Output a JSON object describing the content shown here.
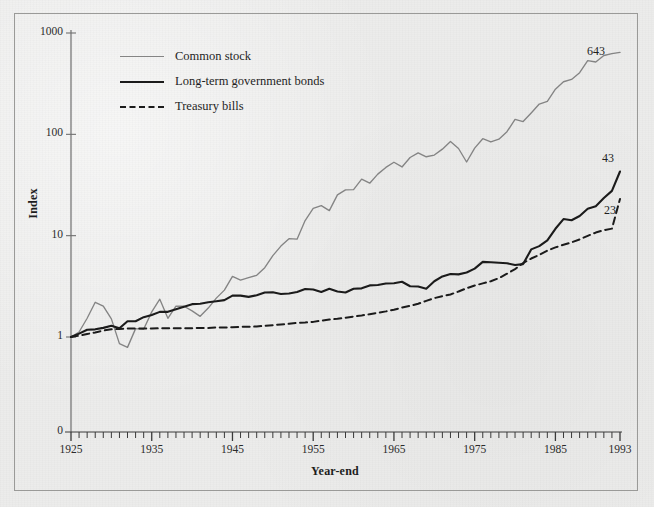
{
  "figure": {
    "background_color": "#ececeb",
    "frame_color": "#9a9a98"
  },
  "axes": {
    "y_title": "Index",
    "x_title": "Year-end",
    "y_scale": "log",
    "y_tick_labels": [
      "1000",
      "100",
      "10",
      "1",
      "0"
    ],
    "y_tick_values": [
      1000,
      100,
      10,
      1,
      0
    ],
    "x_tick_labels": [
      "1925",
      "1935",
      "1945",
      "1955",
      "1965",
      "1975",
      "1985",
      "1993"
    ],
    "x_tick_values": [
      1925,
      1935,
      1945,
      1955,
      1965,
      1975,
      1985,
      1993
    ],
    "x_minor_tick_interval_years": 1,
    "x_range": [
      1925,
      1993
    ],
    "y_range": [
      1,
      1000
    ]
  },
  "legend": {
    "position": "top-left-inside",
    "items": [
      {
        "label": "Common stock",
        "style": "solid",
        "color": "#848484",
        "width": 1.3
      },
      {
        "label": "Long-term government bonds",
        "style": "solid",
        "color": "#1b1b1b",
        "width": 2.1
      },
      {
        "label": "Treasury bills",
        "style": "dashed",
        "color": "#1b1b1b",
        "width": 2.0
      }
    ]
  },
  "endpoint_labels": [
    {
      "text": "643",
      "series": "Common stock"
    },
    {
      "text": "43",
      "series": "Long-term government bonds"
    },
    {
      "text": "23",
      "series": "Treasury bills"
    }
  ],
  "chart_data": {
    "type": "line",
    "title": "",
    "subtitle": "",
    "xlabel": "Year-end",
    "ylabel": "Index",
    "xlim": [
      1925,
      1993
    ],
    "ylim": [
      1,
      1000
    ],
    "yscale": "log",
    "grid": false,
    "legend_position": "upper left",
    "x": [
      1925,
      1926,
      1927,
      1928,
      1929,
      1930,
      1931,
      1932,
      1933,
      1934,
      1935,
      1936,
      1937,
      1938,
      1939,
      1940,
      1941,
      1942,
      1943,
      1944,
      1945,
      1946,
      1947,
      1948,
      1949,
      1950,
      1951,
      1952,
      1953,
      1954,
      1955,
      1956,
      1957,
      1958,
      1959,
      1960,
      1961,
      1962,
      1963,
      1964,
      1965,
      1966,
      1967,
      1968,
      1969,
      1970,
      1971,
      1972,
      1973,
      1974,
      1975,
      1976,
      1977,
      1978,
      1979,
      1980,
      1981,
      1982,
      1983,
      1984,
      1985,
      1986,
      1987,
      1988,
      1989,
      1990,
      1991,
      1992,
      1993
    ],
    "series": [
      {
        "name": "Common stock",
        "color": "#848484",
        "style": "solid",
        "end_label": "643",
        "values": [
          1.0,
          1.12,
          1.53,
          2.2,
          2.02,
          1.51,
          0.86,
          0.79,
          1.21,
          1.19,
          1.77,
          2.36,
          1.53,
          2.02,
          2.01,
          1.81,
          1.6,
          1.93,
          2.42,
          2.9,
          3.96,
          3.64,
          3.85,
          4.06,
          4.83,
          6.36,
          7.89,
          9.34,
          9.24,
          14.11,
          18.57,
          19.78,
          17.65,
          25.3,
          28.32,
          28.46,
          36.11,
          32.96,
          40.47,
          47.16,
          53.01,
          47.67,
          59.11,
          65.63,
          60.06,
          62.47,
          71.41,
          84.95,
          72.5,
          53.3,
          73.14,
          90.58,
          84.08,
          89.58,
          106.11,
          140.5,
          133.62,
          162.42,
          199.06,
          211.59,
          278.62,
          330.46,
          347.89,
          405.6,
          533.91,
          517.5,
          675.59,
          727.38,
          800.08
        ],
        "plot_values": [
          1.0,
          1.12,
          1.53,
          2.2,
          2.02,
          1.51,
          0.86,
          0.79,
          1.21,
          1.19,
          1.77,
          2.36,
          1.53,
          2.02,
          2.01,
          1.81,
          1.6,
          1.93,
          2.42,
          2.9,
          3.96,
          3.64,
          3.85,
          4.06,
          4.83,
          6.36,
          7.89,
          9.34,
          9.24,
          14.11,
          18.57,
          19.78,
          17.65,
          25.3,
          28.32,
          28.46,
          36.11,
          32.96,
          40.47,
          47.16,
          53.01,
          47.67,
          59.11,
          65.63,
          60.06,
          62.47,
          71.41,
          84.95,
          72.5,
          53.3,
          73.14,
          90.58,
          84.08,
          89.58,
          106.11,
          140.5,
          133.62,
          162.42,
          199.06,
          211.59,
          278.62,
          330.46,
          347.89,
          405.6,
          533.91,
          517.5,
          600.0,
          625.0,
          643.0
        ]
      },
      {
        "name": "Long-term government bonds",
        "color": "#1b1b1b",
        "style": "solid",
        "end_label": "43",
        "values": [
          1.0,
          1.08,
          1.18,
          1.19,
          1.23,
          1.29,
          1.22,
          1.43,
          1.43,
          1.57,
          1.65,
          1.77,
          1.77,
          1.88,
          1.99,
          2.11,
          2.13,
          2.2,
          2.25,
          2.31,
          2.56,
          2.56,
          2.49,
          2.58,
          2.75,
          2.76,
          2.66,
          2.69,
          2.78,
          2.98,
          2.94,
          2.78,
          2.99,
          2.81,
          2.75,
          2.99,
          3.02,
          3.23,
          3.26,
          3.37,
          3.39,
          3.51,
          3.17,
          3.15,
          3.0,
          3.55,
          3.96,
          4.19,
          4.15,
          4.33,
          4.73,
          5.51,
          5.47,
          5.4,
          5.34,
          5.13,
          5.24,
          7.32,
          7.88,
          8.98,
          11.69,
          14.58,
          14.21,
          15.62,
          18.43,
          19.53,
          23.49,
          27.67,
          43.0
        ],
        "plot_values": [
          1.0,
          1.08,
          1.18,
          1.19,
          1.23,
          1.29,
          1.22,
          1.43,
          1.43,
          1.57,
          1.65,
          1.77,
          1.77,
          1.88,
          1.99,
          2.11,
          2.13,
          2.2,
          2.25,
          2.31,
          2.56,
          2.56,
          2.49,
          2.58,
          2.75,
          2.76,
          2.66,
          2.69,
          2.78,
          2.98,
          2.94,
          2.78,
          2.99,
          2.81,
          2.75,
          2.99,
          3.02,
          3.23,
          3.26,
          3.37,
          3.39,
          3.51,
          3.17,
          3.15,
          3.0,
          3.55,
          3.96,
          4.19,
          4.15,
          4.33,
          4.73,
          5.51,
          5.47,
          5.4,
          5.34,
          5.13,
          5.24,
          7.32,
          7.88,
          8.98,
          11.69,
          14.58,
          14.21,
          15.62,
          18.43,
          19.53,
          23.49,
          27.67,
          43.0
        ]
      },
      {
        "name": "Treasury bills",
        "color": "#1b1b1b",
        "style": "dashed",
        "end_label": "23",
        "values": [
          1.0,
          1.03,
          1.07,
          1.11,
          1.16,
          1.19,
          1.2,
          1.21,
          1.21,
          1.21,
          1.21,
          1.22,
          1.22,
          1.22,
          1.22,
          1.22,
          1.23,
          1.23,
          1.24,
          1.24,
          1.25,
          1.26,
          1.26,
          1.27,
          1.29,
          1.31,
          1.33,
          1.35,
          1.38,
          1.39,
          1.41,
          1.45,
          1.49,
          1.51,
          1.55,
          1.59,
          1.63,
          1.68,
          1.73,
          1.79,
          1.86,
          1.95,
          2.03,
          2.13,
          2.27,
          2.42,
          2.53,
          2.63,
          2.81,
          3.03,
          3.22,
          3.38,
          3.55,
          3.81,
          4.21,
          4.68,
          5.37,
          5.95,
          6.47,
          7.11,
          7.66,
          8.13,
          8.58,
          9.18,
          9.96,
          10.73,
          11.33,
          11.73,
          23.0
        ],
        "plot_values": [
          1.0,
          1.03,
          1.07,
          1.11,
          1.16,
          1.19,
          1.2,
          1.21,
          1.21,
          1.21,
          1.21,
          1.22,
          1.22,
          1.22,
          1.22,
          1.22,
          1.23,
          1.23,
          1.24,
          1.24,
          1.25,
          1.26,
          1.26,
          1.27,
          1.29,
          1.31,
          1.33,
          1.35,
          1.38,
          1.39,
          1.41,
          1.45,
          1.49,
          1.51,
          1.55,
          1.59,
          1.63,
          1.68,
          1.73,
          1.79,
          1.86,
          1.95,
          2.03,
          2.13,
          2.27,
          2.42,
          2.53,
          2.63,
          2.81,
          3.03,
          3.22,
          3.38,
          3.55,
          3.81,
          4.21,
          4.68,
          5.37,
          5.95,
          6.47,
          7.11,
          7.66,
          8.13,
          8.58,
          9.18,
          9.96,
          10.73,
          11.33,
          11.73,
          23.0
        ]
      }
    ]
  }
}
